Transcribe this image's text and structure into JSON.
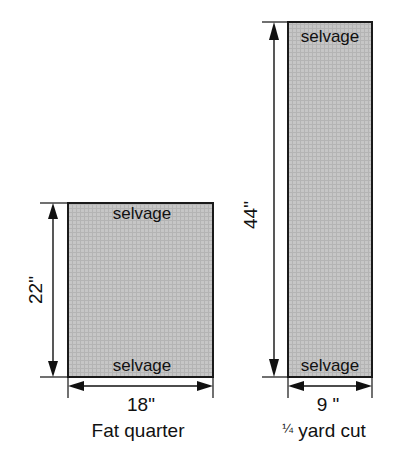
{
  "figure": {
    "title_hidden": "",
    "colors": {
      "fabric_fill": "#c3c3c3",
      "fabric_stroke": "#1a1a1a",
      "line": "#111111",
      "background": "#ffffff"
    }
  },
  "left_figure": {
    "name": "fat-quarter",
    "caption": "Fat quarter",
    "top_selvage_label": "selvage",
    "bottom_selvage_label": "selvage",
    "height_label": "22\"",
    "width_label": "18\"",
    "height_inches": 22,
    "width_inches": 18
  },
  "right_figure": {
    "name": "quarter-yard-cut",
    "caption_fraction": "¼",
    "caption_rest": " yard cut",
    "caption_full": "¼ yard cut",
    "top_selvage_label": "selvage",
    "bottom_selvage_label": "selvage",
    "height_label": "44\"",
    "width_label": "9 \"",
    "height_inches": 44,
    "width_inches": 9
  }
}
